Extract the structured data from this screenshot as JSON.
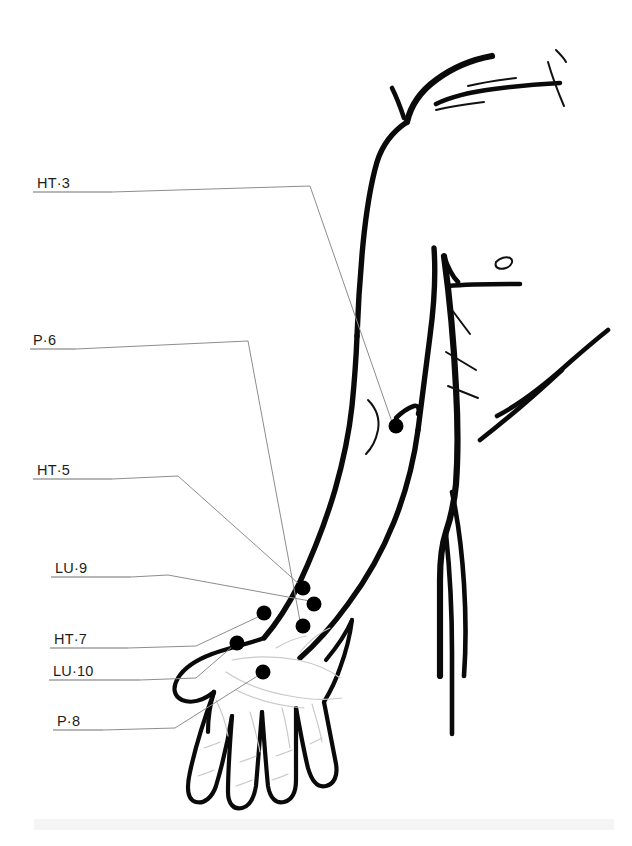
{
  "figure": {
    "background_color": "#ffffff",
    "ink_color": "#0a0a0a",
    "leader_color": "#8d8d8d",
    "width": 632,
    "height": 846
  },
  "points": [
    {
      "id": "ht3",
      "label": "HT·3",
      "meridian": "HT",
      "number": "3",
      "label_x": 37,
      "label_baseline_y": 188,
      "rule_start_x": 33,
      "rule_end_x": 112,
      "rule_y": 192,
      "leader_path": "M112,192 L310,186 L392,422",
      "dot_x": 396,
      "dot_y": 426,
      "dot_r": 7.5
    },
    {
      "id": "p6",
      "label": "P·6",
      "meridian": "P",
      "number": "6",
      "label_x": 33,
      "label_baseline_y": 345,
      "rule_start_x": 30,
      "rule_end_x": 76,
      "rule_y": 349,
      "leader_path": "M76,349 L248,341 L300,621",
      "dot_x": 303,
      "dot_y": 626,
      "dot_r": 7.5
    },
    {
      "id": "ht5",
      "label": "HT·5",
      "meridian": "HT",
      "number": "5",
      "label_x": 37,
      "label_baseline_y": 475,
      "rule_start_x": 33,
      "rule_end_x": 112,
      "rule_y": 479,
      "leader_path": "M112,479 L178,476 L299,584",
      "dot_x": 303,
      "dot_y": 588,
      "dot_r": 7.5
    },
    {
      "id": "lu9",
      "label": "LU·9",
      "meridian": "LU",
      "number": "9",
      "label_x": 55,
      "label_baseline_y": 573,
      "rule_start_x": 51,
      "rule_end_x": 131,
      "rule_y": 577,
      "leader_path": "M131,577 L168,575 L310,601",
      "dot_x": 314,
      "dot_y": 604,
      "dot_r": 7.5
    },
    {
      "id": "ht7",
      "label": "HT·7",
      "meridian": "HT",
      "number": "7",
      "label_x": 54,
      "label_baseline_y": 644,
      "rule_start_x": 50,
      "rule_end_x": 128,
      "rule_y": 648,
      "leader_path": "M128,648 L196,646 L260,616",
      "dot_x": 264,
      "dot_y": 613,
      "dot_r": 7.5
    },
    {
      "id": "lu10",
      "label": "LU·10",
      "meridian": "LU",
      "number": "10",
      "label_x": 53,
      "label_baseline_y": 676,
      "rule_start_x": 49,
      "rule_end_x": 140,
      "rule_y": 680,
      "leader_path": "M140,680 L196,678 L233,646",
      "dot_x": 237,
      "dot_y": 643,
      "dot_r": 7.5
    },
    {
      "id": "p8",
      "label": "P·8",
      "meridian": "P",
      "number": "8",
      "label_x": 57,
      "label_baseline_y": 726,
      "rule_start_x": 53,
      "rule_end_x": 103,
      "rule_y": 730,
      "leader_path": "M103,730 L175,728 L259,675",
      "dot_x": 263,
      "dot_y": 672,
      "dot_r": 7.5
    }
  ],
  "anatomy": {
    "shoulder_top": "M407,122 C412,100 425,88 436,80 C452,68 470,60 492,56",
    "clavicle": "M436,104 C452,96 470,92 494,89 C516,86 540,84 560,83",
    "neck_stub": "M404,118 C400,106 396,96 392,88",
    "deltoid_outer": "M407,122 C392,132 382,146 377,162 C370,186 366,214 363,244 C360,276 358,308 357,336",
    "arm_outer_lower": "M357,336 C356,362 354,386 352,406 C349,434 343,462 335,490 C325,524 312,556 299,584 C288,606 276,624 264,638",
    "forearm_inner": "M418,430 C414,460 406,492 394,522 C382,552 366,580 348,604 C332,626 316,644 300,658",
    "armpit_line": "M434,248 C436,276 434,306 430,336 C426,366 422,398 418,430",
    "elbow_notch": "M396,418 C402,412 408,408 414,406 C418,405 420,408 418,414",
    "torso_side": "M444,256 C450,300 454,346 456,388 C458,424 458,456 456,484 C454,506 450,520 446,532 C442,544 440,560 440,580 C440,614 440,650 440,676",
    "chest_line": "M448,286 C470,284 496,284 520,284",
    "chest_curve": "M444,256 C448,268 452,276 458,282",
    "pec_lower": "M497,416 C520,404 548,382 570,362 C586,348 598,338 608,330",
    "nipple": "M496,262 C500,258 506,256 510,258 C514,260 512,266 506,268 C500,270 494,268 496,262",
    "rib_curve": "M480,440 C506,420 536,394 562,370",
    "hip_line": "M452,492 C458,520 462,552 464,584 C466,616 466,648 464,676",
    "leg_line": "M446,534 C450,572 452,612 452,652 C452,684 452,712 452,734"
  },
  "creases": {
    "armpit_folds": [
      "M452,310 C458,318 464,326 470,334",
      "M446,352 C456,358 466,364 476,370",
      "M448,386 C458,390 468,394 478,398"
    ],
    "shoulder_marks": [
      "M436,110 C452,106 468,104 484,102",
      "M468,86 C484,82 500,80 516,78"
    ],
    "neck_marks": [
      "M548,62 C552,76 558,92 564,106",
      "M556,50 C560,54 564,58 566,62"
    ],
    "elbow_crease": "M368,400 C376,408 380,418 378,430 C376,440 372,448 366,454"
  },
  "hand": {
    "thumb_outer": "M264,638 C248,644 228,648 212,654 C196,660 184,668 178,678 C172,688 174,696 182,700 C192,704 204,700 214,692",
    "palm_left": "M214,692 C210,704 208,718 208,732",
    "finger_index": "M214,692 C206,714 196,744 190,772 C186,790 188,800 196,802 C204,804 212,798 216,786 C222,766 228,740 232,716",
    "finger_middle": "M232,716 C230,742 228,772 228,792 C228,804 234,810 242,808 C250,806 254,798 256,786 C258,762 260,736 262,712",
    "finger_ring": "M262,712 C264,738 266,766 268,786 C270,798 276,804 284,802 C292,800 296,792 296,780 C296,756 296,730 296,708",
    "finger_little": "M296,708 C300,730 304,752 308,768 C312,782 318,788 326,786 C334,784 338,776 336,764 C332,744 328,722 324,702",
    "hand_right_edge": "M324,702 C330,692 336,680 340,668 C346,652 350,636 352,620",
    "wrist_right": "M352,620 C346,634 336,648 326,660",
    "palm_creases": [
      "M232,660 C252,656 276,656 298,660 C316,664 330,670 340,678",
      "M226,672 C244,684 266,692 290,696 C310,700 328,700 342,698",
      "M236,690 C256,700 280,706 304,708",
      "M250,712 C254,726 258,740 260,752",
      "M282,708 C286,722 288,736 290,748",
      "M312,704 C316,718 320,730 322,742",
      "M216,700 C222,712 226,724 228,736",
      "M300,652 C310,640 320,632 330,628",
      "M276,648 C286,642 296,638 306,636"
    ],
    "knuckle_marks": [
      "M204,748 C210,746 216,744 220,742",
      "M240,762 C246,760 252,758 256,756",
      "M276,756 C282,754 288,752 292,750",
      "M310,744 C314,742 318,740 322,738",
      "M198,776 C204,774 210,772 214,770",
      "M236,786 C242,784 248,782 252,780",
      "M272,780 C278,778 284,776 288,774"
    ]
  }
}
